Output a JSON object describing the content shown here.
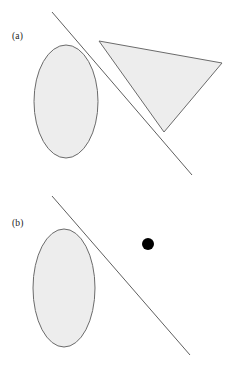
{
  "figure": {
    "width": 234,
    "height": 370,
    "background_color": "#ffffff",
    "shape_fill_color": "#ededed",
    "shape_stroke_color": "#6b6b6b",
    "line_color": "#5f5f5f",
    "dot_color": "#000000",
    "label_color": "#1a1a1a"
  },
  "panels": [
    {
      "id": "a",
      "label": "(a)",
      "label_x": 12,
      "label_y": 39,
      "ellipse": {
        "name": "convex-set-ellipse",
        "cx": 66,
        "cy": 101.5,
        "rx": 32,
        "ry": 56.5
      },
      "triangle": {
        "name": "convex-set-triangle",
        "points": "99,41 222,63 164,132"
      },
      "line": {
        "name": "separating-hyperplane-line",
        "x1": 52,
        "y1": 12,
        "x2": 192,
        "y2": 175
      }
    },
    {
      "id": "b",
      "label": "(b)",
      "label_x": 12,
      "label_y": 226,
      "ellipse": {
        "name": "convex-set-ellipse",
        "cx": 64,
        "cy": 288,
        "rx": 31,
        "ry": 59
      },
      "point": {
        "name": "external-point-dot",
        "cx": 148,
        "cy": 244,
        "r": 6
      },
      "line": {
        "name": "separating-hyperplane-line",
        "x1": 52,
        "y1": 196,
        "x2": 190,
        "y2": 355
      }
    }
  ]
}
